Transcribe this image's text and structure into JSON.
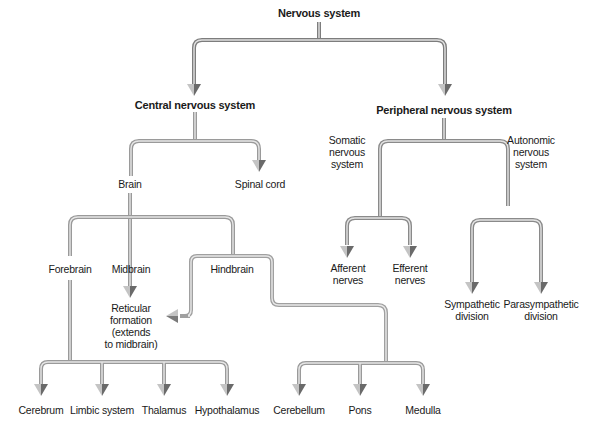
{
  "diagram": {
    "title": "Nervous system",
    "type": "hierarchy-tree",
    "colors": {
      "line_outer": "#8a8a8a",
      "line_inner": "#d9d9d9",
      "arrow_dark": "#6e6e6e",
      "arrow_light": "#b8b8b8",
      "text": "#1a1a1a",
      "background": "#ffffff"
    },
    "nodes": {
      "root": "Nervous system",
      "cns": "Central nervous system",
      "pns": "Peripheral nervous system",
      "brain": "Brain",
      "spinal_cord": "Spinal cord",
      "somatic": [
        "Somatic",
        "nervous",
        "system"
      ],
      "autonomic": [
        "Autonomic",
        "nervous",
        "system"
      ],
      "forebrain": "Forebrain",
      "midbrain": "Midbrain",
      "hindbrain": "Hindbrain",
      "reticular": [
        "Reticular",
        "formation",
        "(extends",
        "to midbrain)"
      ],
      "afferent": [
        "Afferent",
        "nerves"
      ],
      "efferent": [
        "Efferent",
        "nerves"
      ],
      "sympathetic": [
        "Sympathetic",
        "division"
      ],
      "parasympathetic": [
        "Parasympathetic",
        "division"
      ],
      "cerebrum": "Cerebrum",
      "limbic": "Limbic system",
      "thalamus": "Thalamus",
      "hypothalamus": "Hypothalamus",
      "cerebellum": "Cerebellum",
      "pons": "Pons",
      "medulla": "Medulla"
    },
    "edges": [
      [
        "Nervous system",
        "Central nervous system"
      ],
      [
        "Nervous system",
        "Peripheral nervous system"
      ],
      [
        "Central nervous system",
        "Brain"
      ],
      [
        "Central nervous system",
        "Spinal cord"
      ],
      [
        "Peripheral nervous system",
        "Somatic nervous system"
      ],
      [
        "Peripheral nervous system",
        "Autonomic nervous system"
      ],
      [
        "Somatic nervous system",
        "Afferent nerves"
      ],
      [
        "Somatic nervous system",
        "Efferent nerves"
      ],
      [
        "Autonomic nervous system",
        "Sympathetic division"
      ],
      [
        "Autonomic nervous system",
        "Parasympathetic division"
      ],
      [
        "Brain",
        "Forebrain"
      ],
      [
        "Brain",
        "Midbrain"
      ],
      [
        "Brain",
        "Hindbrain"
      ],
      [
        "Midbrain",
        "Reticular formation (extends to midbrain)"
      ],
      [
        "Hindbrain",
        "Reticular formation (extends to midbrain)"
      ],
      [
        "Forebrain",
        "Cerebrum"
      ],
      [
        "Forebrain",
        "Limbic system"
      ],
      [
        "Forebrain",
        "Thalamus"
      ],
      [
        "Forebrain",
        "Hypothalamus"
      ],
      [
        "Hindbrain",
        "Cerebellum"
      ],
      [
        "Hindbrain",
        "Pons"
      ],
      [
        "Hindbrain",
        "Medulla"
      ]
    ]
  }
}
